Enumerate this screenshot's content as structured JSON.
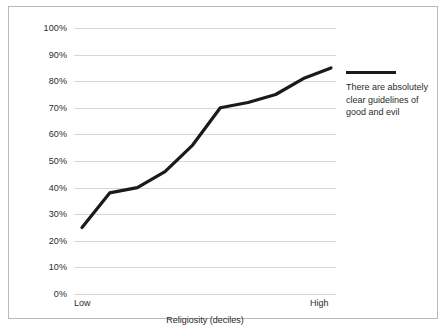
{
  "chart_data": {
    "type": "line",
    "title": "",
    "xlabel": "Religiosity (deciles)",
    "ylabel": "",
    "categories": [
      "1",
      "2",
      "3",
      "4",
      "5",
      "6",
      "7",
      "8",
      "9",
      "10"
    ],
    "x_axis_end_labels": {
      "left": "Low",
      "right": "High"
    },
    "ylim": [
      0,
      100
    ],
    "y_tick_labels": [
      "100%",
      "90%",
      "80%",
      "70%",
      "60%",
      "50%",
      "40%",
      "30%",
      "20%",
      "10%",
      "0%"
    ],
    "y_tick_values": [
      100,
      90,
      80,
      70,
      60,
      50,
      40,
      30,
      20,
      10,
      0
    ],
    "grid": true,
    "legend_position": "right",
    "series": [
      {
        "name": "There are absolutely clear guidelines of good and evil",
        "color": "#1a1a1a",
        "values": [
          25,
          38,
          40,
          46,
          56,
          70,
          72,
          75,
          81,
          85
        ]
      }
    ]
  },
  "legend": {
    "entries": [
      {
        "label": "There are absolutely clear guidelines of good and evil",
        "color": "#1a1a1a"
      }
    ]
  },
  "axes": {
    "x_title": "Religiosity (deciles)",
    "x_low": "Low",
    "x_high": "High"
  },
  "colors": {
    "series_line": "#1a1a1a",
    "gridline": "#d6d6d6",
    "border": "#b9b9b9",
    "text": "#2b2b2b",
    "background": "#ffffff"
  }
}
